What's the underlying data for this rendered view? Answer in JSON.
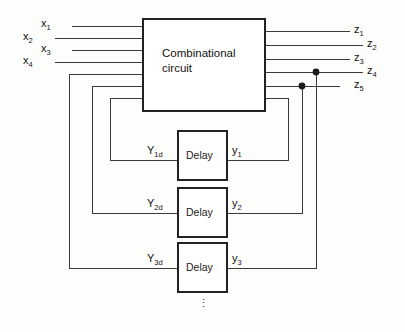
{
  "diagram": {
    "main_block": {
      "label_line1": "Combinational",
      "label_line2": "circuit",
      "name": "combinational-circuit"
    },
    "inputs": [
      {
        "id": "x1",
        "label": "x",
        "sub": "1"
      },
      {
        "id": "x2",
        "label": "x",
        "sub": "2"
      },
      {
        "id": "x3",
        "label": "x",
        "sub": "3"
      },
      {
        "id": "x4",
        "label": "x",
        "sub": "4"
      }
    ],
    "outputs": [
      {
        "id": "z1",
        "label": "z",
        "sub": "1"
      },
      {
        "id": "z2",
        "label": "z",
        "sub": "2"
      },
      {
        "id": "z3",
        "label": "z",
        "sub": "3"
      },
      {
        "id": "z4",
        "label": "z",
        "sub": "4"
      },
      {
        "id": "z5",
        "label": "z",
        "sub": "5"
      }
    ],
    "delays": [
      {
        "id": "delay1",
        "label": "Delay",
        "input_label": "Y",
        "input_sub": "1d",
        "output_label": "y",
        "output_sub": "1"
      },
      {
        "id": "delay2",
        "label": "Delay",
        "input_label": "Y",
        "input_sub": "2d",
        "output_label": "y",
        "output_sub": "2"
      },
      {
        "id": "delay3",
        "label": "Delay",
        "input_label": "Y",
        "input_sub": "3d",
        "output_label": "y",
        "output_sub": "3"
      }
    ],
    "continuation": "⋮",
    "junction_dots": 2,
    "colors": {
      "line": "#3a3a3a",
      "box_border": "#222222",
      "background": "#fdfdfc",
      "text": "#111111"
    }
  }
}
